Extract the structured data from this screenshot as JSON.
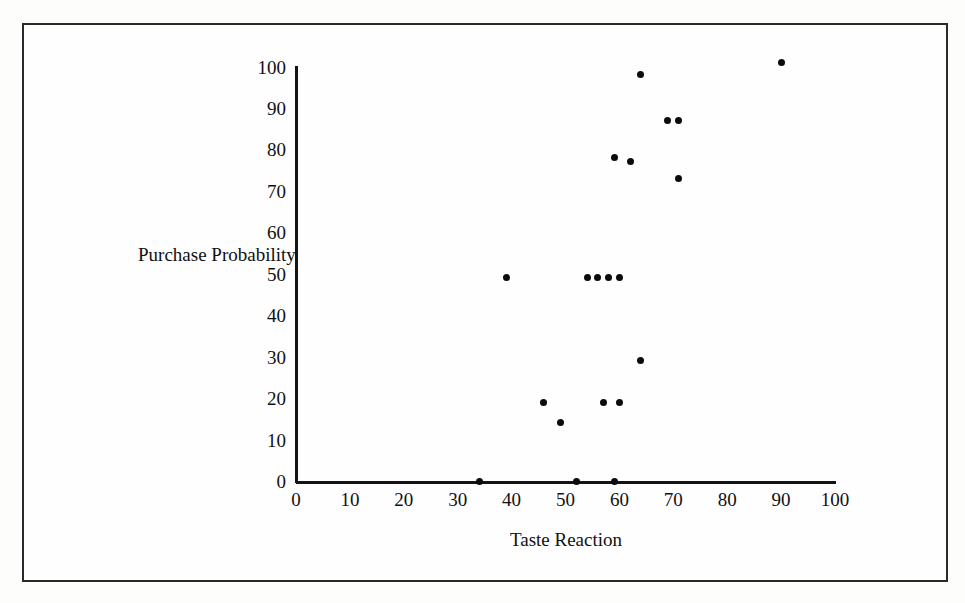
{
  "figure": {
    "background_color": "#fefefe",
    "frame_color": "#2a2a2a",
    "marker_color": "#0b0b0b"
  },
  "chart_data": {
    "type": "scatter",
    "title": "",
    "xlabel": "Taste Reaction",
    "ylabel": "Purchase Probability",
    "xlim": [
      0,
      100
    ],
    "ylim": [
      0,
      100
    ],
    "grid": false,
    "legend": null,
    "x_ticks": [
      0,
      10,
      20,
      30,
      40,
      50,
      60,
      70,
      80,
      90,
      100
    ],
    "y_ticks": [
      0,
      10,
      20,
      30,
      40,
      50,
      60,
      70,
      80,
      90,
      100
    ],
    "x_tick_labels": [
      "0",
      "10",
      "20",
      "30",
      "40",
      "50",
      "60",
      "70",
      "80",
      "90",
      "100"
    ],
    "y_tick_labels": [
      "0",
      "10",
      "20",
      "30",
      "40",
      "50",
      "60",
      "70",
      "80",
      "90",
      "100"
    ],
    "series": [
      {
        "name": "observations",
        "marker": "filled-circle",
        "color": "#0b0b0b",
        "points": [
          {
            "x": 34,
            "y": 0
          },
          {
            "x": 52,
            "y": 0
          },
          {
            "x": 59,
            "y": 0
          },
          {
            "x": 49,
            "y": 14
          },
          {
            "x": 46,
            "y": 19
          },
          {
            "x": 57,
            "y": 19
          },
          {
            "x": 60,
            "y": 19
          },
          {
            "x": 64,
            "y": 29
          },
          {
            "x": 39,
            "y": 49
          },
          {
            "x": 54,
            "y": 49
          },
          {
            "x": 56,
            "y": 49
          },
          {
            "x": 58,
            "y": 49
          },
          {
            "x": 60,
            "y": 49
          },
          {
            "x": 71,
            "y": 73
          },
          {
            "x": 59,
            "y": 78
          },
          {
            "x": 62,
            "y": 77
          },
          {
            "x": 69,
            "y": 87
          },
          {
            "x": 71,
            "y": 87
          },
          {
            "x": 64,
            "y": 98
          },
          {
            "x": 90,
            "y": 101
          }
        ]
      }
    ]
  }
}
